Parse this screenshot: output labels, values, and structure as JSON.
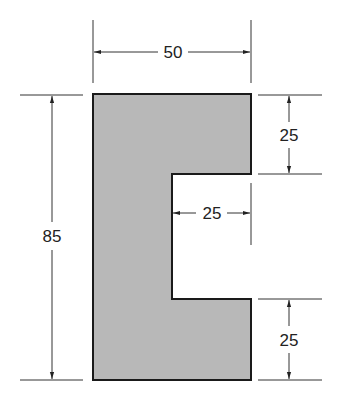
{
  "diagram": {
    "type": "dimensioned-section",
    "shape": "C-channel cross-section",
    "fill_color": "#b8b8b8",
    "outline_color": "#1a1a1a",
    "dimensions": {
      "overall_width": "50",
      "overall_height": "85",
      "top_flange_height": "25",
      "bottom_flange_height": "25",
      "notch_depth": "25"
    }
  }
}
